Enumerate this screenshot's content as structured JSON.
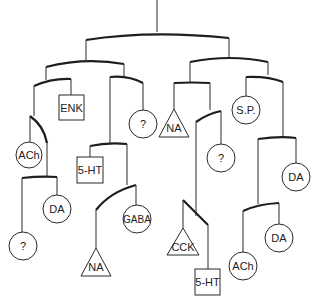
{
  "diagram": {
    "type": "tree",
    "nodes": [
      {
        "id": "n-enk",
        "shape": "square",
        "label": "ENK"
      },
      {
        "id": "n-ach-1",
        "shape": "circle",
        "label": "ACh"
      },
      {
        "id": "n-q-1",
        "shape": "circle",
        "label": "?"
      },
      {
        "id": "n-5ht-1",
        "shape": "square",
        "label": "5-HT"
      },
      {
        "id": "n-da-1",
        "shape": "circle",
        "label": "DA"
      },
      {
        "id": "n-q-2",
        "shape": "circle",
        "label": "?"
      },
      {
        "id": "n-gaba",
        "shape": "circle",
        "label": "GABA"
      },
      {
        "id": "n-na-1",
        "shape": "triangle",
        "label": "NA"
      },
      {
        "id": "n-na-2",
        "shape": "triangle",
        "label": "NA"
      },
      {
        "id": "n-q-3",
        "shape": "circle",
        "label": "?"
      },
      {
        "id": "n-sp",
        "shape": "circle",
        "label": "S.P."
      },
      {
        "id": "n-da-2",
        "shape": "circle",
        "label": "DA"
      },
      {
        "id": "n-cck",
        "shape": "triangle",
        "label": "CCK"
      },
      {
        "id": "n-5ht-2",
        "shape": "square",
        "label": "5-HT"
      },
      {
        "id": "n-ach-2",
        "shape": "circle",
        "label": "ACh"
      },
      {
        "id": "n-da-3",
        "shape": "circle",
        "label": "DA"
      }
    ]
  }
}
